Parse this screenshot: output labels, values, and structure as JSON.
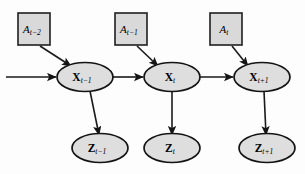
{
  "figure": {
    "kind": "dynamic-bayesian-network",
    "background_color": "#fdfdfd",
    "node_box_fill": "#d9d9d9",
    "node_ellipse_fill": "#dedede",
    "stroke_color": "#141414"
  },
  "nodes": {
    "action_nodes": [
      {
        "id": "a-t-minus-2",
        "base": "A",
        "sub": "t−2",
        "shape": "square",
        "cx": 34,
        "cy": 29
      },
      {
        "id": "a-t-minus-1",
        "base": "A",
        "sub": "t−1",
        "shape": "square",
        "cx": 131,
        "cy": 29
      },
      {
        "id": "a-t",
        "base": "A",
        "sub": "t",
        "shape": "square",
        "cx": 226,
        "cy": 29
      }
    ],
    "state_nodes": [
      {
        "id": "x-t-minus-1",
        "base": "X",
        "sub": "t−1",
        "shape": "ellipse",
        "cx": 85,
        "cy": 77
      },
      {
        "id": "x-t",
        "base": "X",
        "sub": "t",
        "shape": "ellipse",
        "cx": 172,
        "cy": 77
      },
      {
        "id": "x-t-plus-1",
        "base": "X",
        "sub": "t+1",
        "shape": "ellipse",
        "cx": 261,
        "cy": 77
      }
    ],
    "observation_nodes": [
      {
        "id": "z-t-minus-1",
        "base": "Z",
        "sub": "t−1",
        "shape": "ellipse",
        "cx": 100,
        "cy": 148
      },
      {
        "id": "z-t",
        "base": "Z",
        "sub": "t",
        "shape": "ellipse",
        "cx": 172,
        "cy": 148
      },
      {
        "id": "z-t-plus-1",
        "base": "Z",
        "sub": "t+1",
        "shape": "ellipse",
        "cx": 267,
        "cy": 148
      }
    ]
  },
  "edges": [
    {
      "id": "edge-incoming-left",
      "from": "left-boundary",
      "to": "x-t-minus-1",
      "style": "straight-arrow"
    },
    {
      "id": "edge-a2-to-x1",
      "from": "a-t-minus-2",
      "to": "x-t-minus-1",
      "style": "diagonal-arrow"
    },
    {
      "id": "edge-a1-to-x2",
      "from": "a-t-minus-1",
      "to": "x-t",
      "style": "diagonal-arrow"
    },
    {
      "id": "edge-a0-to-x3",
      "from": "a-t",
      "to": "x-t-plus-1",
      "style": "diagonal-arrow"
    },
    {
      "id": "edge-x1-to-x2",
      "from": "x-t-minus-1",
      "to": "x-t",
      "style": "straight-arrow"
    },
    {
      "id": "edge-x2-to-x3",
      "from": "x-t",
      "to": "x-t-plus-1",
      "style": "straight-arrow"
    },
    {
      "id": "edge-x1-to-z1",
      "from": "x-t-minus-1",
      "to": "z-t-minus-1",
      "style": "vertical-arrow"
    },
    {
      "id": "edge-x2-to-z2",
      "from": "x-t",
      "to": "z-t",
      "style": "vertical-arrow"
    },
    {
      "id": "edge-x3-to-z3",
      "from": "x-t-plus-1",
      "to": "z-t-plus-1",
      "style": "vertical-arrow"
    }
  ]
}
